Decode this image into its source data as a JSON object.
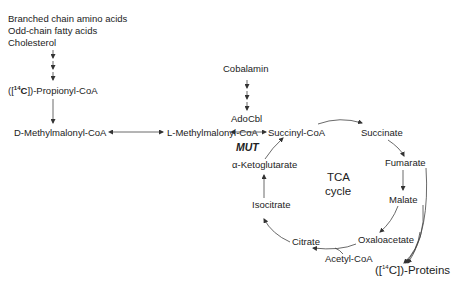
{
  "diagram": {
    "sources": [
      "Branched chain amino acids",
      "Odd-chain fatty acids",
      "Cholesterol"
    ],
    "propionyl": {
      "prefix": "([",
      "isotope_sup": "14",
      "isotope": "C",
      "suffix": "])-Propionyl-CoA"
    },
    "d_methylmalonyl": "D-Methylmalonyl-CoA",
    "l_methylmalonyl": "L-Methylmalonyl-CoA",
    "cobalamin": "Cobalamin",
    "adocbl": "AdoCbl",
    "enzyme": "MUT",
    "tca": {
      "center_line1": "TCA",
      "center_line2": "cycle",
      "intermediates": {
        "succinyl_coa": "Succinyl-CoA",
        "succinate": "Succinate",
        "fumarate": "Fumarate",
        "malate": "Malate",
        "oxaloacetate": "Oxaloacetate",
        "citrate": "Citrate",
        "isocitrate": "Isocitrate",
        "alpha_ketoglutarate": "α-Ketoglutarate"
      },
      "acetyl_coa": "Acetyl-CoA"
    },
    "proteins": {
      "prefix": "([",
      "isotope_sup": "14",
      "isotope": "C",
      "suffix": "])-Proteins"
    }
  }
}
